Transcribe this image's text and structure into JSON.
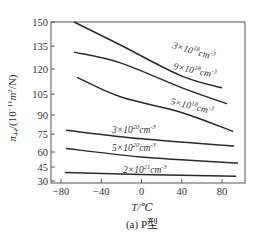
{
  "chart_data": {
    "type": "line",
    "title": "",
    "caption": "(a) P型",
    "xlabel": "T/℃",
    "ylabel": "π44/(10⁻¹¹m²/N)",
    "xlim": [
      -85,
      100
    ],
    "ylim": [
      30,
      150
    ],
    "xticks": [
      -80,
      -40,
      0,
      40,
      80
    ],
    "yticks": [
      150,
      135,
      120,
      105,
      90,
      75,
      60,
      45,
      30
    ],
    "grid": false,
    "legend": "inline labels",
    "series": [
      {
        "name": "3×10¹⁸cm⁻³",
        "x": [
          -67,
          -21,
          39,
          80
        ],
        "values": [
          150,
          135.6,
          116,
          108.6
        ]
      },
      {
        "name": "9×10¹⁸cm⁻³",
        "x": [
          -67,
          -21,
          39,
          85
        ],
        "values": [
          131,
          124,
          109,
          98
        ]
      },
      {
        "name": "5×10¹⁸cm⁻³",
        "x": [
          -64,
          -21,
          39,
          91
        ],
        "values": [
          115,
          103,
          92,
          77
        ]
      },
      {
        "name": "3×10²⁰cm⁻³",
        "x": [
          -75,
          0,
          92
        ],
        "values": [
          78,
          71,
          65
        ]
      },
      {
        "name": "5×10²⁰cm⁻³",
        "x": [
          -75,
          0,
          96
        ],
        "values": [
          63,
          55,
          49
        ]
      },
      {
        "name": "2×10²¹cm⁻³",
        "x": [
          -76,
          0,
          94
        ],
        "values": [
          39,
          37,
          35
        ]
      }
    ]
  },
  "labels": {
    "ytitle_main": "π",
    "ytitle_sub": "44",
    "ytitle_rest": "/(10",
    "ytitle_exp1": "−11",
    "ytitle_unit": "m",
    "ytitle_exp2": "2",
    "ytitle_end": "/N)",
    "xtitle": "T/℃",
    "caption": "(a) P型",
    "curves": [
      {
        "base": "3×10",
        "exp": "18",
        "unit": "cm",
        "uexp": "-3"
      },
      {
        "base": "9×10",
        "exp": "18",
        "unit": "cm",
        "uexp": "-3"
      },
      {
        "base": "5×10",
        "exp": "18",
        "unit": "cm",
        "uexp": "-3"
      },
      {
        "base": "3×10",
        "exp": "20",
        "unit": "cm",
        "uexp": "-3"
      },
      {
        "base": "5×10",
        "exp": "20",
        "unit": "cm",
        "uexp": "-3"
      },
      {
        "base": "2×10",
        "exp": "21",
        "unit": "cm",
        "uexp": "-3"
      }
    ]
  }
}
